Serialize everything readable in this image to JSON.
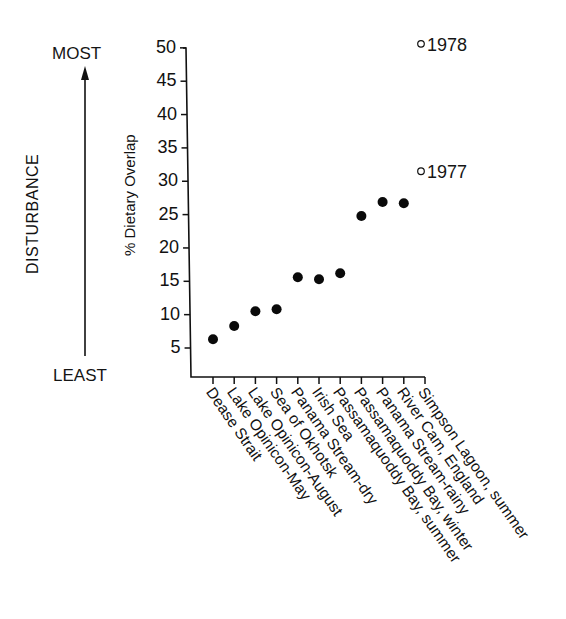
{
  "chart_data": {
    "type": "scatter",
    "title": "",
    "xlabel": "",
    "ylabel": "% Dietary Overlap",
    "ylim": [
      0,
      50
    ],
    "yticks": [
      5,
      10,
      15,
      20,
      25,
      30,
      35,
      40,
      45,
      50
    ],
    "grid": false,
    "categories": [
      "Dease Strait",
      "Lake Opinicon-May",
      "Lake Opinicon-August",
      "Sea of Okhotsk",
      "Panama Stream-dry",
      "Irish Sea",
      "Passamaquoddy Bay, summer",
      "Passamaquoddy Bay, winter",
      "Panama Stream-rainy",
      "River Cam, England",
      "Simpson Lagoon, summer"
    ],
    "series": [
      {
        "name": "filled",
        "marker": "filled-circle",
        "values": [
          6.3,
          8.3,
          10.5,
          10.8,
          15.6,
          15.3,
          16.2,
          24.8,
          26.9,
          26.7,
          null
        ]
      },
      {
        "name": "Simpson Lagoon (open)",
        "marker": "open-circle",
        "points": [
          {
            "category": "Simpson Lagoon, summer",
            "value": 50.6,
            "label": "1978"
          },
          {
            "category": "Simpson Lagoon, summer",
            "value": 31.5,
            "label": "1977"
          }
        ]
      }
    ],
    "annotations": {
      "disturbance_axis": {
        "label": "DISTURBANCE",
        "top": "MOST",
        "bottom": "LEAST"
      }
    }
  },
  "labels": {
    "most": "MOST",
    "least": "LEAST",
    "disturbance": "DISTURBANCE",
    "ylabel": "% Dietary Overlap",
    "y1978": "1978",
    "y1977": "1977"
  }
}
